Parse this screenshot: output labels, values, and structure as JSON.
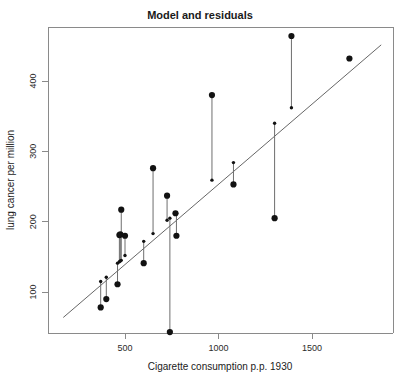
{
  "chart_data": {
    "type": "scatter",
    "title": "Model and residuals",
    "xlabel": "Cigarette consumption p.p. 1930",
    "ylabel": "lung cancer per million",
    "xlim": [
      170,
      1870
    ],
    "ylim": [
      25,
      480
    ],
    "xticks": [
      500,
      1000,
      1500
    ],
    "xtick_labels": [
      "500",
      "1000",
      "1500"
    ],
    "yticks": [
      100,
      200,
      300,
      400
    ],
    "ytick_labels": [
      "100",
      "200",
      "300",
      "400"
    ],
    "grid": false,
    "legend": null,
    "fit_line": {
      "name": "least squares regression line",
      "slope": 0.228,
      "intercept": 25.0,
      "x_start": 170,
      "x_end": 1870,
      "y_start": 63.8,
      "y_end": 451.4
    },
    "series": [
      {
        "name": "observed lung cancer rate",
        "marker": "filled-circle",
        "color": "#121212",
        "points": [
          {
            "x": 370,
            "y": 78
          },
          {
            "x": 400,
            "y": 90
          },
          {
            "x": 460,
            "y": 111
          },
          {
            "x": 470,
            "y": 181
          },
          {
            "x": 475,
            "y": 182
          },
          {
            "x": 480,
            "y": 217
          },
          {
            "x": 500,
            "y": 180
          },
          {
            "x": 600,
            "y": 141
          },
          {
            "x": 650,
            "y": 276
          },
          {
            "x": 725,
            "y": 237
          },
          {
            "x": 740,
            "y": 43
          },
          {
            "x": 775,
            "y": 180
          },
          {
            "x": 770,
            "y": 212
          },
          {
            "x": 965,
            "y": 380
          },
          {
            "x": 1080,
            "y": 253
          },
          {
            "x": 1300,
            "y": 205
          },
          {
            "x": 1390,
            "y": 464
          },
          {
            "x": 1700,
            "y": 432
          }
        ]
      },
      {
        "name": "fitted values on regression line",
        "marker": "small-filled-circle",
        "color": "#121212",
        "points": [
          {
            "x": 370,
            "y": 115
          },
          {
            "x": 400,
            "y": 121
          },
          {
            "x": 460,
            "y": 141
          },
          {
            "x": 470,
            "y": 143
          },
          {
            "x": 475,
            "y": 144
          },
          {
            "x": 480,
            "y": 145
          },
          {
            "x": 500,
            "y": 152
          },
          {
            "x": 600,
            "y": 172
          },
          {
            "x": 650,
            "y": 183
          },
          {
            "x": 725,
            "y": 202
          },
          {
            "x": 740,
            "y": 205
          },
          {
            "x": 775,
            "y": 212
          },
          {
            "x": 965,
            "y": 259
          },
          {
            "x": 1080,
            "y": 284
          },
          {
            "x": 1300,
            "y": 340
          },
          {
            "x": 1390,
            "y": 362
          },
          {
            "x": 1700,
            "y": 432
          }
        ]
      }
    ],
    "residual_segments": [
      {
        "x": 370,
        "y_observed": 78,
        "y_fitted": 115
      },
      {
        "x": 400,
        "y_observed": 90,
        "y_fitted": 121
      },
      {
        "x": 460,
        "y_observed": 111,
        "y_fitted": 141
      },
      {
        "x": 470,
        "y_observed": 181,
        "y_fitted": 143
      },
      {
        "x": 475,
        "y_observed": 182,
        "y_fitted": 144
      },
      {
        "x": 480,
        "y_observed": 217,
        "y_fitted": 145
      },
      {
        "x": 500,
        "y_observed": 180,
        "y_fitted": 152
      },
      {
        "x": 600,
        "y_observed": 141,
        "y_fitted": 172
      },
      {
        "x": 650,
        "y_observed": 276,
        "y_fitted": 183
      },
      {
        "x": 725,
        "y_observed": 237,
        "y_fitted": 202
      },
      {
        "x": 740,
        "y_observed": 43,
        "y_fitted": 205
      },
      {
        "x": 775,
        "y_observed": 180,
        "y_fitted": 212
      },
      {
        "x": 965,
        "y_observed": 380,
        "y_fitted": 259
      },
      {
        "x": 1080,
        "y_observed": 253,
        "y_fitted": 284
      },
      {
        "x": 1300,
        "y_observed": 205,
        "y_fitted": 340
      },
      {
        "x": 1390,
        "y_observed": 464,
        "y_fitted": 362
      }
    ],
    "colors": {
      "point": "#121212",
      "fit_line": "#555555",
      "residual": "#6e6e6e",
      "frame": "#8a8a8a",
      "background": "#ffffff"
    }
  }
}
